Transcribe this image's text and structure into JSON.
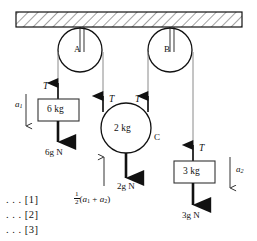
{
  "figure": {
    "ceiling": {
      "name": "hatched ceiling support",
      "hatch_pattern": "diagonal-hatch"
    },
    "colors": {
      "stroke": "#111111",
      "rope": "#6e6e6e",
      "fill": "#ffffff",
      "hatch": "#555555"
    },
    "pulleys": [
      {
        "id": "A",
        "label": "A",
        "cx": 80,
        "cy": 50,
        "r": 22
      },
      {
        "id": "B",
        "label": "B",
        "cx": 170,
        "cy": 50,
        "r": 22
      }
    ],
    "bodies": [
      {
        "id": "block-6kg",
        "label": "6 kg",
        "shape": "rectangle"
      },
      {
        "id": "pulley-c-2kg",
        "label": "2 kg",
        "tag": "C",
        "shape": "circle"
      },
      {
        "id": "block-3kg",
        "label": "3 kg",
        "shape": "rectangle"
      }
    ],
    "tensions": [
      {
        "id": "tension-left",
        "label": "T"
      },
      {
        "id": "tension-c-left",
        "label": "T"
      },
      {
        "id": "tension-c-right",
        "label": "T"
      },
      {
        "id": "tension-right",
        "label": "T"
      }
    ],
    "weights": [
      {
        "id": "weight-6kg",
        "label": "6g N"
      },
      {
        "id": "weight-2kg",
        "label": "2g N"
      },
      {
        "id": "weight-3kg",
        "label": "3g N"
      }
    ],
    "accelerations": [
      {
        "id": "accel-a1",
        "base": "a",
        "sub": "1",
        "direction": "down"
      },
      {
        "id": "accel-a2",
        "base": "a",
        "sub": "2",
        "direction": "down"
      },
      {
        "id": "accel-c",
        "direction": "up",
        "fraction_num": "1",
        "fraction_den": "2",
        "expr_open": "(",
        "expr_a1_base": "a",
        "expr_a1_sub": "1",
        "expr_plus": "+",
        "expr_a2_base": "a",
        "expr_a2_sub": "2",
        "expr_close": ")"
      }
    ],
    "equation_refs": [
      {
        "id": "eqn-1",
        "text": ". . . [1]"
      },
      {
        "id": "eqn-2",
        "text": ". . . [2]"
      },
      {
        "id": "eqn-3",
        "text": ". . . [3]"
      }
    ]
  }
}
